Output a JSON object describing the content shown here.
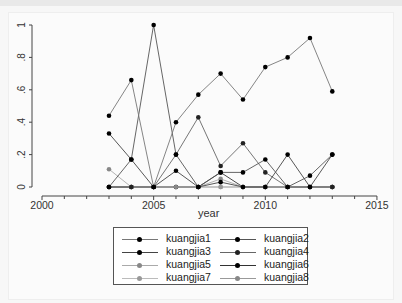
{
  "chart_data": {
    "type": "line",
    "title": "",
    "xlabel": "year",
    "ylabel": "",
    "x": [
      2003,
      2004,
      2005,
      2006,
      2007,
      2008,
      2009,
      2010,
      2011,
      2012,
      2013
    ],
    "xlim": [
      2000,
      2015
    ],
    "ylim": [
      0,
      1
    ],
    "x_ticks": [
      2000,
      2005,
      2010,
      2015
    ],
    "x_tick_labels": [
      "2000",
      "2005",
      "2010",
      "2015"
    ],
    "y_ticks": [
      0,
      0.2,
      0.4,
      0.6,
      0.8,
      1
    ],
    "y_tick_labels": [
      "0",
      ".2",
      ".4",
      ".6",
      ".8",
      "1"
    ],
    "grid": false,
    "legend_position": "bottom",
    "series": [
      {
        "name": "kuangjia1",
        "color": "#777777",
        "marker": "#000000",
        "values": [
          0.44,
          0.66,
          0,
          0.4,
          0.57,
          0.7,
          0.54,
          0.74,
          0.8,
          0.92,
          0.59
        ]
      },
      {
        "name": "kuangjia2",
        "color": "#555555",
        "marker": "#000000",
        "values": [
          0,
          0.17,
          1.0,
          0.2,
          0,
          0.09,
          0.09,
          0.17,
          0,
          0.07,
          0.2
        ]
      },
      {
        "name": "kuangjia3",
        "color": "#444444",
        "marker": "#000000",
        "values": [
          0.33,
          0.17,
          0,
          0.1,
          0,
          0.03,
          0,
          0,
          0.2,
          0,
          0.2
        ]
      },
      {
        "name": "kuangjia4",
        "color": "#666666",
        "marker": "#222222",
        "values": [
          0,
          0,
          0,
          0.2,
          0.43,
          0.13,
          0.27,
          0.09,
          0,
          0,
          0
        ]
      },
      {
        "name": "kuangjia5",
        "color": "#aaaaaa",
        "marker": "#888888",
        "values": [
          0.11,
          0,
          0,
          0,
          0,
          0.05,
          0,
          0,
          0,
          0,
          0
        ]
      },
      {
        "name": "kuangjia6",
        "color": "#333333",
        "marker": "#000000",
        "values": [
          0,
          0,
          0,
          0,
          0,
          0.09,
          0,
          0,
          0,
          0,
          0
        ]
      },
      {
        "name": "kuangjia7",
        "color": "#bbbbbb",
        "marker": "#999999",
        "values": [
          0,
          0,
          0,
          0,
          0,
          0,
          0,
          0,
          0,
          0,
          0
        ]
      },
      {
        "name": "kuangjia8",
        "color": "#999999",
        "marker": "#888888",
        "values": [
          0,
          0,
          0,
          0,
          0,
          0,
          0,
          0,
          0,
          0,
          0
        ]
      }
    ]
  },
  "legend": {
    "items": [
      "kuangjia1",
      "kuangjia2",
      "kuangjia3",
      "kuangjia4",
      "kuangjia5",
      "kuangjia6",
      "kuangjia7",
      "kuangjia8"
    ]
  },
  "axes": {
    "xlabel": "year"
  }
}
